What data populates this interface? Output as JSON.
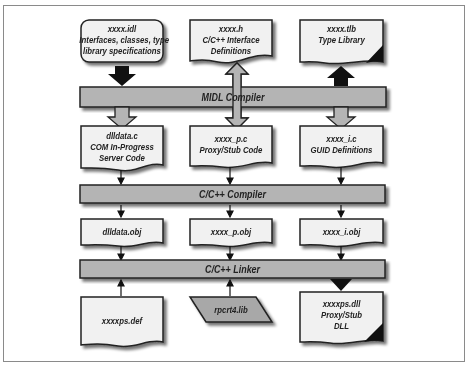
{
  "diagram": {
    "colors": {
      "doc_fill": "#f1f1f1",
      "bar_fill": "#b4b4b4",
      "outline": "#222222",
      "shadow": "#9a9a9a",
      "frame": "#8a8a8a"
    },
    "top_row": [
      {
        "name": "xxxx.idl",
        "desc_line1": "Interfaces, classes, type",
        "desc_line2": "library specifications",
        "shape": "rounded-rect"
      },
      {
        "name": "xxxx.h",
        "desc_line1": "C/C++ Interface",
        "desc_line2": "Definitions",
        "shape": "document"
      },
      {
        "name": "xxxx.tlb",
        "desc_line1": "Type Library",
        "desc_line2": "",
        "shape": "document-dark-corner"
      }
    ],
    "midl_compiler": {
      "label": "MIDL Compiler"
    },
    "source_row": [
      {
        "name": "dlldata.c",
        "desc_line1": "COM In-Progress",
        "desc_line2": "Server Code"
      },
      {
        "name": "xxxx_p.c",
        "desc_line1": "Proxy/Stub Code",
        "desc_line2": ""
      },
      {
        "name": "xxxx_i.c",
        "desc_line1": "GUID Definitions",
        "desc_line2": ""
      }
    ],
    "cpp_compiler": {
      "label": "C/C++ Compiler"
    },
    "obj_row": [
      {
        "name": "dlldata.obj"
      },
      {
        "name": "xxxx_p.obj"
      },
      {
        "name": "xxxx_i.obj"
      }
    ],
    "cpp_linker": {
      "label": "C/C++ Linker"
    },
    "bottom_row": [
      {
        "name": "xxxxps.def",
        "desc_line1": "",
        "desc_line2": "",
        "shape": "document"
      },
      {
        "name": "rpcrt4.lib",
        "desc_line1": "",
        "desc_line2": "",
        "shape": "parallelogram"
      },
      {
        "name": "xxxxps.dll",
        "desc_line1": "Proxy/Stub",
        "desc_line2": "DLL",
        "shape": "document-dark-corner"
      }
    ]
  }
}
